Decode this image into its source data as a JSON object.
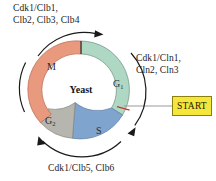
{
  "diagram": {
    "organism": "Yeast",
    "title_center": "Yeast",
    "type": "cell-cycle-ring",
    "phases": [
      {
        "id": "g1",
        "label": "G",
        "subscript": "1",
        "color": "#aed7c4",
        "start_deg": 0,
        "end_deg": 122
      },
      {
        "id": "s",
        "label": "S",
        "subscript": "",
        "color": "#7fa5cf",
        "start_deg": 122,
        "end_deg": 190
      },
      {
        "id": "g2",
        "label": "G",
        "subscript": "2",
        "color": "#b7b6ae",
        "start_deg": 190,
        "end_deg": 228
      },
      {
        "id": "m",
        "label": "M",
        "subscript": "",
        "color": "#e99a7e",
        "start_deg": 228,
        "end_deg": 360
      }
    ],
    "annotations": {
      "m_cyclins_line1": "Cdk1/Clb1,",
      "m_cyclins_line2": "Clb2, Clb3, Clb4",
      "g1_cyclins_line1": "Cdk1/Cln1,",
      "g1_cyclins_line2": "Cln2, Cln3",
      "s_cyclins_line1": "Cdk1/Clb5, Clb6"
    },
    "start_checkpoint": {
      "label": "START",
      "box_fill": "#f5e63c",
      "box_border": "#8d7f12",
      "marker_color": "#c0392b",
      "connector_color": "#9a9a9a"
    },
    "arrow_color": "#1a1a1a",
    "divider_color": "#2a2a2a"
  }
}
